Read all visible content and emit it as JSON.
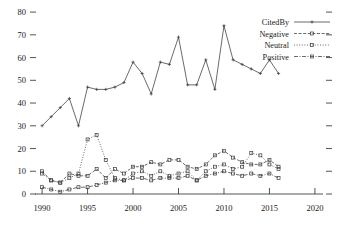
{
  "chart_data": {
    "type": "line",
    "title": "",
    "xlabel": "",
    "ylabel": "",
    "xlim": [
      1989.0,
      2021.0
    ],
    "ylim": [
      0,
      84
    ],
    "grid": false,
    "legend_position": "top-right",
    "x_ticks": [
      1990,
      1995,
      2000,
      2005,
      2010,
      2015,
      2020
    ],
    "y_ticks": [
      0,
      10,
      20,
      30,
      40,
      50,
      60,
      70,
      80
    ],
    "x": [
      1990,
      1991,
      1992,
      1993,
      1994,
      1995,
      1996,
      1997,
      1998,
      1999,
      2000,
      2001,
      2002,
      2003,
      2004,
      2005,
      2006,
      2007,
      2008,
      2009,
      2010,
      2011,
      2012,
      2013,
      2014,
      2015,
      2016
    ],
    "series": [
      {
        "name": "CitedBy",
        "style": "solid",
        "marker": "plus",
        "values": [
          30,
          34,
          38,
          42,
          30,
          47,
          46,
          46,
          47,
          49,
          58,
          53,
          44,
          58,
          57,
          69,
          48,
          48,
          59,
          46,
          74,
          59,
          57,
          55,
          53,
          59,
          53
        ]
      },
      {
        "name": "Negative",
        "style": "dashed",
        "marker": "square",
        "values": [
          10,
          6,
          5,
          9,
          8,
          8,
          11,
          7,
          11,
          9,
          12,
          12,
          14,
          13,
          15,
          15,
          12,
          11,
          13,
          17,
          19,
          16,
          14,
          13,
          13,
          15,
          12
        ]
      },
      {
        "name": "Neutral",
        "style": "dotted",
        "marker": "square",
        "values": [
          9,
          6,
          5,
          7,
          9,
          24,
          26,
          15,
          7,
          6,
          9,
          10,
          8,
          10,
          8,
          9,
          10,
          6,
          10,
          12,
          13,
          11,
          12,
          18,
          17,
          13,
          11
        ]
      },
      {
        "name": "Positive",
        "style": "dashdot",
        "marker": "square",
        "values": [
          3,
          2,
          1,
          2,
          3,
          3,
          4,
          5,
          6,
          6,
          7,
          7,
          6,
          7,
          7,
          7,
          8,
          6,
          8,
          9,
          10,
          9,
          8,
          9,
          8,
          9,
          7
        ]
      }
    ]
  },
  "legend": {
    "entries": [
      {
        "label": "CitedBy"
      },
      {
        "label": "Negative"
      },
      {
        "label": "Neutral"
      },
      {
        "label": "Positive"
      }
    ]
  },
  "axis": {
    "x_tick_labels": [
      "1990",
      "1995",
      "2000",
      "2005",
      "2010",
      "2015",
      "2020"
    ],
    "y_tick_labels": [
      "0",
      "10",
      "20",
      "30",
      "40",
      "50",
      "60",
      "70",
      "80"
    ]
  }
}
